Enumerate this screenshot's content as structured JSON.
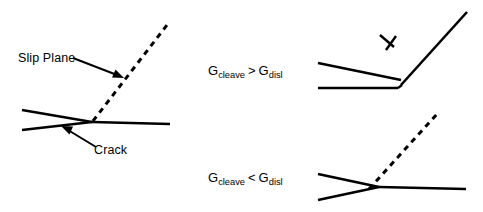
{
  "figure": {
    "background_color": "#ffffff",
    "line_color": "#000000",
    "width": 483,
    "height": 212
  },
  "panels": {
    "left": {
      "name": "crack-with-slip-plane",
      "labels": {
        "slip_plane": "Slip Plane",
        "crack": "Crack"
      },
      "features": [
        "upper crack face",
        "lower crack face",
        "crack tip",
        "horizontal crack extension",
        "dashed inclined slip plane"
      ]
    },
    "top_right": {
      "name": "cleavage-dominant",
      "condition": {
        "symbol": "G",
        "left_subscript": "cleave",
        "operator": ">",
        "right_subscript": "disl",
        "text": "Gcleave > Gdisl"
      },
      "features": [
        "blunted crack opening",
        "kinked cleavage crack",
        "dislocation symbol"
      ],
      "dislocation_symbol": "perpendicular-tee"
    },
    "bottom_right": {
      "name": "dislocation-emission-dominant",
      "condition": {
        "symbol": "G",
        "left_subscript": "cleave",
        "operator": "<",
        "right_subscript": "disl",
        "text": "Gcleave < Gdisl"
      },
      "features": [
        "crack wedge",
        "horizontal crack extension",
        "dashed emitted slip plane"
      ]
    }
  },
  "geometry": {
    "left_panel": {
      "upper_face": [
        [
          22,
          110
        ],
        [
          92,
          122
        ]
      ],
      "lower_face": [
        [
          22,
          129
        ],
        [
          92,
          122
        ]
      ],
      "extension": [
        [
          92,
          122
        ],
        [
          170,
          124
        ]
      ],
      "slip_plane_dashed": [
        [
          92,
          122
        ],
        [
          167,
          25
        ]
      ],
      "slip_arrow": [
        [
          73,
          58
        ],
        [
          122,
          77
        ]
      ],
      "crack_arrow": [
        [
          95,
          148
        ],
        [
          62,
          128
        ]
      ]
    },
    "top_right_panel": {
      "upper_face": [
        [
          318,
          63
        ],
        [
          400,
          79
        ]
      ],
      "lower_face": [
        [
          318,
          88
        ],
        [
          398,
          88
        ]
      ],
      "vertex": [
        402,
        85
      ],
      "cleavage_line": [
        [
          402,
          85
        ],
        [
          467,
          12
        ]
      ],
      "dislocation_mark": [
        [
          383,
          38
        ],
        [
          398,
          52
        ]
      ]
    },
    "bottom_right_panel": {
      "upper_face": [
        [
          318,
          174
        ],
        [
          378,
          187
        ]
      ],
      "lower_face": [
        [
          318,
          199
        ],
        [
          378,
          187
        ]
      ],
      "extension": [
        [
          378,
          187
        ],
        [
          466,
          189
        ]
      ],
      "slip_plane_dashed": [
        [
          369,
          189
        ],
        [
          437,
          115
        ]
      ]
    }
  }
}
